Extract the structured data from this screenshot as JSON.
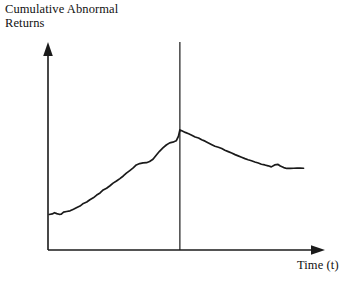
{
  "chart_data": {
    "type": "line",
    "title": "",
    "ylabel": "Cumulative Abnormal\nReturns",
    "xlabel": "Time (t)",
    "grid": false,
    "legend": null,
    "axis_style": "arrow-terminated",
    "xlim": [
      0,
      100
    ],
    "ylim": [
      0,
      100
    ],
    "annotations": [
      {
        "name": "event-date-line",
        "type": "vertical-line",
        "x": 46.6,
        "label": ""
      }
    ],
    "series": [
      {
        "name": "Cumulative Abnormal Returns",
        "color": "#1a1a1a",
        "points": [
          [
            0.4,
            20.3
          ],
          [
            1.5,
            20.6
          ],
          [
            2.3,
            21.3
          ],
          [
            3.1,
            20.8
          ],
          [
            3.9,
            20.4
          ],
          [
            4.7,
            20.5
          ],
          [
            5.5,
            21.6
          ],
          [
            6.6,
            22.0
          ],
          [
            7.8,
            22.4
          ],
          [
            9.0,
            23.3
          ],
          [
            10.2,
            24.3
          ],
          [
            11.3,
            25.1
          ],
          [
            12.5,
            26.6
          ],
          [
            13.7,
            27.4
          ],
          [
            14.8,
            28.7
          ],
          [
            16.0,
            29.8
          ],
          [
            17.2,
            31.4
          ],
          [
            18.4,
            32.6
          ],
          [
            19.5,
            34.3
          ],
          [
            20.7,
            35.3
          ],
          [
            21.9,
            36.7
          ],
          [
            23.0,
            38.2
          ],
          [
            24.2,
            39.4
          ],
          [
            25.4,
            40.8
          ],
          [
            26.6,
            42.3
          ],
          [
            27.7,
            43.9
          ],
          [
            28.9,
            45.4
          ],
          [
            30.1,
            46.9
          ],
          [
            31.2,
            48.6
          ],
          [
            32.4,
            49.4
          ],
          [
            33.6,
            49.8
          ],
          [
            34.8,
            49.9
          ],
          [
            35.9,
            50.6
          ],
          [
            37.1,
            51.9
          ],
          [
            38.3,
            54.3
          ],
          [
            39.4,
            56.4
          ],
          [
            40.6,
            58.3
          ],
          [
            41.8,
            60.0
          ],
          [
            43.0,
            61.2
          ],
          [
            44.1,
            61.6
          ],
          [
            45.3,
            62.4
          ],
          [
            46.1,
            65.0
          ],
          [
            46.6,
            68.6
          ],
          [
            47.3,
            68.1
          ],
          [
            48.5,
            67.2
          ],
          [
            49.7,
            66.4
          ],
          [
            50.8,
            65.6
          ],
          [
            52.0,
            64.6
          ],
          [
            53.2,
            64.0
          ],
          [
            54.3,
            63.0
          ],
          [
            55.5,
            62.2
          ],
          [
            56.7,
            61.2
          ],
          [
            57.9,
            60.2
          ],
          [
            59.0,
            59.3
          ],
          [
            60.2,
            58.7
          ],
          [
            61.4,
            58.0
          ],
          [
            62.5,
            57.0
          ],
          [
            63.7,
            56.2
          ],
          [
            64.9,
            55.4
          ],
          [
            66.1,
            54.5
          ],
          [
            67.2,
            53.8
          ],
          [
            68.4,
            53.0
          ],
          [
            69.6,
            52.2
          ],
          [
            70.7,
            51.6
          ],
          [
            71.9,
            51.0
          ],
          [
            73.1,
            50.3
          ],
          [
            74.3,
            49.7
          ],
          [
            75.4,
            49.0
          ],
          [
            76.6,
            48.6
          ],
          [
            77.8,
            48.1
          ],
          [
            78.9,
            47.5
          ],
          [
            80.1,
            48.6
          ],
          [
            81.3,
            48.9
          ],
          [
            82.1,
            48.0
          ],
          [
            83.3,
            47.1
          ],
          [
            84.4,
            46.6
          ],
          [
            85.6,
            46.6
          ],
          [
            86.8,
            46.7
          ],
          [
            88.0,
            46.8
          ],
          [
            89.1,
            46.8
          ],
          [
            90.3,
            46.7
          ]
        ]
      }
    ]
  },
  "colors": {
    "line": "#1a1a1a",
    "axis": "#1a1a1a",
    "event_line": "#1a1a1a",
    "background": "#ffffff"
  }
}
